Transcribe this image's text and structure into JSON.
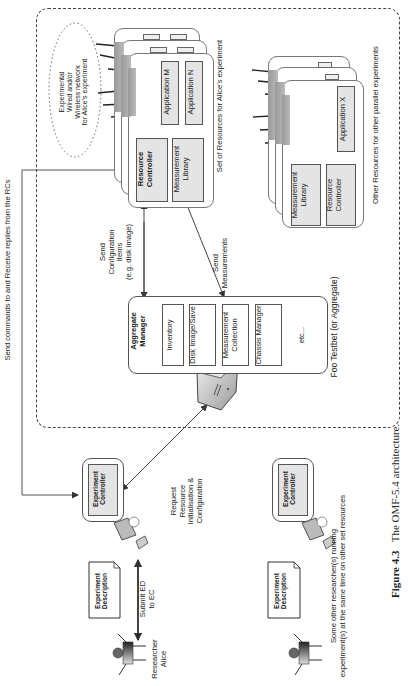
{
  "figure": {
    "caption_label": "Figure 4.3",
    "caption_text": "The OMF-5.4 architecture."
  },
  "testbed": {
    "title": "Foo Testbet (or Aggregate)"
  },
  "alice_resources": {
    "label": "Set of Resources for Alice's experiment",
    "network_label_lines": [
      "Experimental",
      "Wired and/or",
      "Wireless network",
      "for Alice's experiment"
    ],
    "application_m": "Application M",
    "application_n": "Application N",
    "resource_controller": "Resource Controller",
    "measurement_library": "Measurement Library"
  },
  "other_resources": {
    "label": "Other Resources for other parallel experiments",
    "application_x": "Application X",
    "measurement_library": "Measurement Library",
    "resource_controller": "Resource Controller"
  },
  "aggregate_manager": {
    "title": "Aggregate Manager",
    "modules": [
      "Inventory",
      "Disk Image/Save",
      "Measurement Collection",
      "Chassis Manager"
    ],
    "etc": "etc..."
  },
  "arrows": {
    "send_config": [
      "Send",
      "Configuration",
      "Items",
      "(e.g. disk image)"
    ],
    "send_measurements": [
      "Send",
      "Measurements"
    ],
    "send_commands": "Send commands to and Receive replies from the RCs",
    "request_resource": [
      "Request",
      "Resource",
      "Initialisation &",
      "Configuration"
    ],
    "submit_ed": [
      "Submit ED",
      "to EC"
    ]
  },
  "alice": {
    "researcher_label": [
      "Researcher",
      "Alice"
    ],
    "experiment_description": "Experiment Description",
    "experiment_controller": "Experiment Controller"
  },
  "other_researchers": {
    "label_lines": [
      "Some other researcher(s) running",
      "experiment(s) at the same time on other set resources"
    ],
    "experiment_description": "Experiment Description",
    "experiment_controller": "Experiment Controller"
  }
}
